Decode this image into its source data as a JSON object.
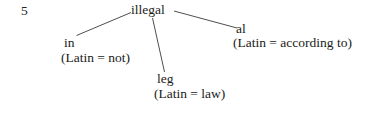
{
  "item": {
    "number": "5"
  },
  "tree": {
    "root": {
      "label": "illegal"
    },
    "branches": [
      {
        "id": "prefix",
        "morpheme": "in",
        "gloss": "(Latin = not)"
      },
      {
        "id": "stem",
        "morpheme": "leg",
        "gloss": "(Latin = law)"
      },
      {
        "id": "suffix",
        "morpheme": "al",
        "gloss": "(Latin = according to)"
      }
    ]
  },
  "style": {
    "background": "#ffffff",
    "text_color": "#1a1a1a",
    "line_color": "#3a3a3a"
  }
}
